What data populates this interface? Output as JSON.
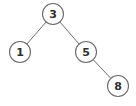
{
  "diagram": {
    "type": "binary-tree",
    "colors": {
      "background": "#ffffff",
      "edge": "#6e6e6e",
      "node_stroke": "#6a6a6a",
      "node_fill": "#ffffff",
      "label": "#2e2e2e"
    },
    "node_radius": 10.5,
    "nodes": [
      {
        "id": "n3",
        "label": "3",
        "cx": 53,
        "cy": 14
      },
      {
        "id": "n1",
        "label": "1",
        "cx": 20,
        "cy": 52
      },
      {
        "id": "n5",
        "label": "5",
        "cx": 86,
        "cy": 52
      },
      {
        "id": "n8",
        "label": "8",
        "cx": 118,
        "cy": 86
      }
    ],
    "edges": [
      {
        "from": "n3",
        "to": "n1"
      },
      {
        "from": "n3",
        "to": "n5"
      },
      {
        "from": "n5",
        "to": "n8"
      }
    ]
  }
}
